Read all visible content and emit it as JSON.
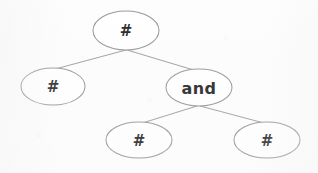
{
  "diagram": {
    "type": "tree",
    "background_color": "#fdfdfd",
    "node_fill_color": "#ffffff",
    "node_stroke_color": "#9a9a9a",
    "edge_color": "#a5a5a5",
    "label_color": "#2b2b2b",
    "nodes": [
      {
        "id": "root",
        "label": "#",
        "label_kind": "hash",
        "cx": 126,
        "cy": 30.5,
        "rx": 33,
        "ry": 19.5,
        "role": "root"
      },
      {
        "id": "left-child",
        "label": "#",
        "label_kind": "hash",
        "cx": 53,
        "cy": 86.5,
        "rx": 32,
        "ry": 18.5,
        "role": "leaf"
      },
      {
        "id": "and-node",
        "label": "and",
        "label_kind": "word",
        "cx": 199,
        "cy": 87.5,
        "rx": 33,
        "ry": 18.5,
        "role": "branch"
      },
      {
        "id": "bottom-left-child",
        "label": "#",
        "label_kind": "hash",
        "cx": 139,
        "cy": 140,
        "rx": 33,
        "ry": 18,
        "role": "leaf"
      },
      {
        "id": "bottom-right-child",
        "label": "#",
        "label_kind": "hash",
        "cx": 267,
        "cy": 140,
        "rx": 33,
        "ry": 18,
        "role": "leaf"
      }
    ],
    "edges": [
      {
        "id": "edge-root-left",
        "from": "root",
        "to": "left-child",
        "x1": 126,
        "y1": 50,
        "x2": 57,
        "y2": 68.5
      },
      {
        "id": "edge-root-and",
        "from": "root",
        "to": "and-node",
        "x1": 127,
        "y1": 50,
        "x2": 192,
        "y2": 69.5
      },
      {
        "id": "edge-and-bleft",
        "from": "and-node",
        "to": "bottom-left-child",
        "x1": 197,
        "y1": 106,
        "x2": 144,
        "y2": 122.5
      },
      {
        "id": "edge-and-bright",
        "from": "and-node",
        "to": "bottom-right-child",
        "x1": 200,
        "y1": 106,
        "x2": 262,
        "y2": 122.5
      }
    ]
  }
}
